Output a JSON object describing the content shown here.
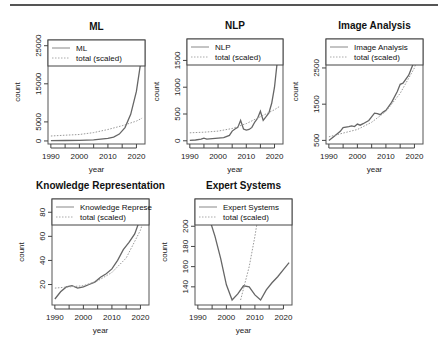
{
  "chart_data": [
    {
      "type": "line",
      "title": "ML",
      "xlabel": "year",
      "ylabel": "count",
      "xlim": [
        1989,
        2023
      ],
      "ylim": [
        -800,
        26500
      ],
      "xticks": [
        1990,
        2000,
        2010,
        2020
      ],
      "yticks": [
        0,
        5000,
        15000,
        25000
      ],
      "legend": [
        "ML",
        "total (scaled)"
      ],
      "series": [
        {
          "name": "ML",
          "x": [
            1990,
            1995,
            2000,
            2005,
            2010,
            2012,
            2014,
            2016,
            2018,
            2020,
            2022
          ],
          "values": [
            100,
            120,
            150,
            300,
            700,
            1000,
            1800,
            3500,
            7000,
            13000,
            23000
          ]
        },
        {
          "name": "total (scaled)",
          "x": [
            1990,
            1995,
            2000,
            2005,
            2010,
            2015,
            2020,
            2022
          ],
          "values": [
            1300,
            1500,
            1700,
            2200,
            3000,
            4000,
            5200,
            6000
          ]
        }
      ]
    },
    {
      "type": "line",
      "title": "NLP",
      "xlabel": "year",
      "ylabel": "count",
      "xlim": [
        1989,
        2023
      ],
      "ylim": [
        -60,
        1900
      ],
      "xticks": [
        1990,
        2000,
        2010,
        2020
      ],
      "yticks": [
        0,
        500,
        1000,
        1500
      ],
      "legend": [
        "NLP",
        "total (scaled)"
      ],
      "series": [
        {
          "name": "NLP",
          "x": [
            1990,
            1992,
            1994,
            1995,
            1996,
            1998,
            2000,
            2002,
            2004,
            2005,
            2006,
            2007,
            2008,
            2009,
            2010,
            2011,
            2012,
            2013,
            2014,
            2015,
            2016,
            2017,
            2018,
            2019,
            2020,
            2021,
            2022
          ],
          "values": [
            10,
            15,
            30,
            50,
            30,
            40,
            50,
            60,
            100,
            180,
            220,
            250,
            380,
            220,
            200,
            210,
            250,
            350,
            420,
            550,
            380,
            450,
            520,
            700,
            1000,
            1500,
            1850
          ]
        },
        {
          "name": "total (scaled)",
          "x": [
            1990,
            1995,
            2000,
            2005,
            2010,
            2015,
            2020,
            2022
          ],
          "values": [
            150,
            160,
            180,
            230,
            320,
            450,
            580,
            650
          ]
        }
      ]
    },
    {
      "type": "line",
      "title": "Image Analysis",
      "xlabel": "year",
      "ylabel": "count",
      "xlim": [
        1989,
        2023
      ],
      "ylim": [
        400,
        3300
      ],
      "xticks": [
        1990,
        2000,
        2010,
        2020
      ],
      "yticks": [
        500,
        1500,
        2500
      ],
      "legend": [
        "Image Analysis",
        "total (scaled)"
      ],
      "series": [
        {
          "name": "Image Analysis",
          "x": [
            1990,
            1992,
            1994,
            1995,
            1997,
            1998,
            1999,
            2000,
            2001,
            2002,
            2004,
            2005,
            2006,
            2007,
            2008,
            2009,
            2010,
            2012,
            2014,
            2015,
            2016,
            2018,
            2020,
            2021,
            2022
          ],
          "values": [
            500,
            620,
            750,
            850,
            880,
            900,
            880,
            950,
            920,
            960,
            1050,
            1150,
            1250,
            1240,
            1210,
            1280,
            1330,
            1550,
            1850,
            2050,
            2080,
            2300,
            2700,
            3100,
            3100
          ]
        },
        {
          "name": "total (scaled)",
          "x": [
            1990,
            1995,
            2000,
            2005,
            2010,
            2015,
            2020,
            2022
          ],
          "values": [
            600,
            700,
            800,
            1000,
            1300,
            1800,
            2500,
            3000
          ]
        }
      ]
    },
    {
      "type": "line",
      "title": "Knowledge Representation",
      "xlabel": "year",
      "ylabel": "count",
      "xlim": [
        1989,
        2023
      ],
      "ylim": [
        3,
        91
      ],
      "xticks": [
        1990,
        2000,
        2010,
        2020
      ],
      "yticks": [
        20,
        40,
        60,
        80
      ],
      "legend": [
        "Knowledge Represe",
        "total (scaled)"
      ],
      "series": [
        {
          "name": "Knowledge Representation",
          "x": [
            1990,
            1992,
            1994,
            1996,
            1998,
            2000,
            2002,
            2004,
            2006,
            2008,
            2010,
            2012,
            2014,
            2016,
            2018,
            2020,
            2022
          ],
          "values": [
            8,
            14,
            18,
            19,
            17,
            18,
            20,
            22,
            26,
            29,
            33,
            40,
            49,
            55,
            62,
            75,
            90
          ]
        },
        {
          "name": "total (scaled)",
          "x": [
            1990,
            1995,
            2000,
            2005,
            2010,
            2015,
            2020,
            2022
          ],
          "values": [
            17,
            18,
            19,
            23,
            30,
            42,
            65,
            80
          ]
        }
      ]
    },
    {
      "type": "line",
      "title": "Expert Systems",
      "xlabel": "year",
      "ylabel": "count",
      "xlim": [
        1989,
        2023
      ],
      "ylim": [
        122,
        227
      ],
      "xticks": [
        1990,
        2000,
        2010,
        2020
      ],
      "yticks": [
        140,
        160,
        180,
        200
      ],
      "legend": [
        "Expert Systems",
        "total (scaled)"
      ],
      "series": [
        {
          "name": "Expert Systems",
          "x": [
            1990,
            1992,
            1994,
            1996,
            1998,
            2000,
            2002,
            2004,
            2006,
            2008,
            2010,
            2012,
            2014,
            2016,
            2018,
            2020,
            2022
          ],
          "values": [
            225,
            220,
            208,
            190,
            168,
            142,
            127,
            133,
            141,
            140,
            132,
            127,
            137,
            144,
            150,
            157,
            164
          ]
        },
        {
          "name": "total (scaled)",
          "x": [
            2005,
            2008,
            2010,
            2012
          ],
          "values": [
            127,
            160,
            190,
            225
          ]
        }
      ]
    }
  ]
}
